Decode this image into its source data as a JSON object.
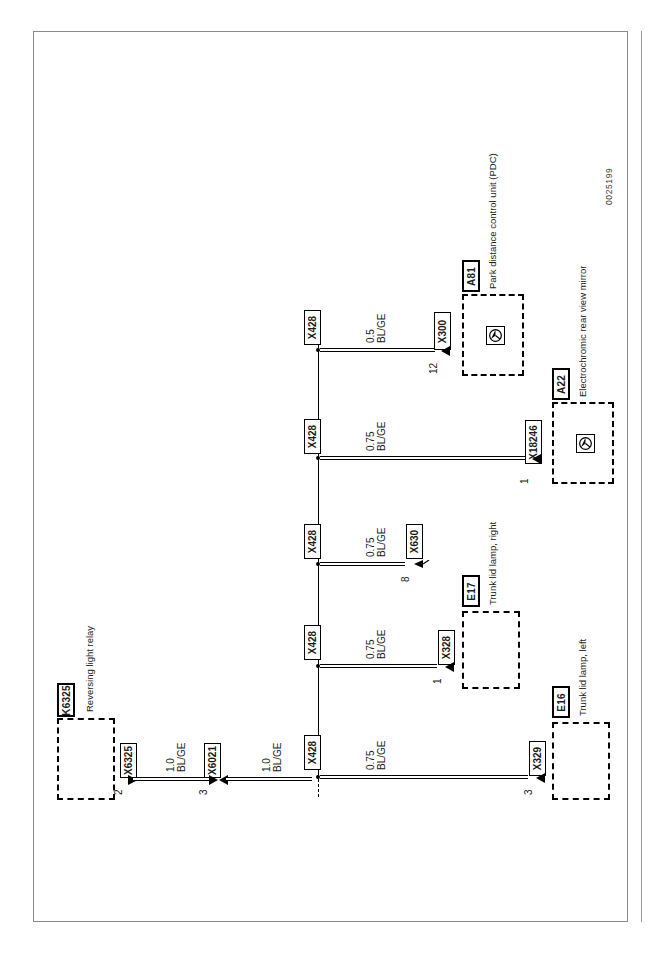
{
  "sheet": {
    "doc_id": "0025199"
  },
  "components": [
    {
      "ref": "K6325",
      "desc": "Reversing light relay",
      "connector": "X6325",
      "pin": "2"
    },
    {
      "ref": "E16",
      "desc": "Trunk lid lamp, left",
      "connector": "X329",
      "pin": "3"
    },
    {
      "ref": "E17",
      "desc": "Trunk lid lamp, right",
      "connector": "X328",
      "pin": "1"
    },
    {
      "ref": "A22",
      "desc": "Electrochromic rear view mirror",
      "connector": "X18246",
      "pin": "1",
      "symbol": "mirror-symbol"
    },
    {
      "ref": "A81",
      "desc": "Park distance control unit (PDC)",
      "connector": "X300",
      "pin": "12",
      "symbol": "pdc-symbol"
    }
  ],
  "inline_connectors": [
    {
      "label": "X6021",
      "pin": "3"
    },
    {
      "label": "X630",
      "pin": "8"
    }
  ],
  "splices": [
    {
      "label": "X428"
    },
    {
      "label": "X428"
    },
    {
      "label": "X428"
    },
    {
      "label": "X428"
    },
    {
      "label": "X428"
    }
  ],
  "wires": [
    {
      "id": "w1",
      "size": "1.0",
      "color": "BL/GE",
      "from": "X6325",
      "to": "X6021"
    },
    {
      "id": "w2",
      "size": "1.0",
      "color": "BL/GE",
      "from": "X6021",
      "to": "X428"
    },
    {
      "id": "w3",
      "size": "0.75",
      "color": "BL/GE",
      "from": "X428",
      "to": "X329"
    },
    {
      "id": "w4",
      "size": "0.75",
      "color": "BL/GE",
      "from": "X428",
      "to": "X328"
    },
    {
      "id": "w5",
      "size": "0.75",
      "color": "BL/GE",
      "from": "X428",
      "to": "X630"
    },
    {
      "id": "w6",
      "size": "0.75",
      "color": "BL/GE",
      "from": "X428",
      "to": "X18246"
    },
    {
      "id": "w7",
      "size": "0.5",
      "color": "BL/GE",
      "from": "X428",
      "to": "X300"
    }
  ]
}
